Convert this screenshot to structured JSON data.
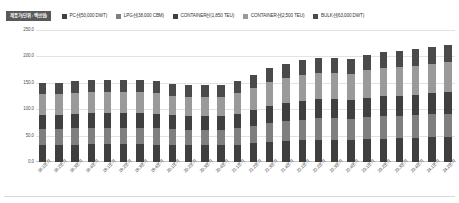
{
  "legend": {
    "unit_badge": "제품가(단위 : 백만원)",
    "items": [
      {
        "label": "PC선(50,000 DWT)",
        "color": "#3f3f3f"
      },
      {
        "label": "LPG선(38,000 CBM)",
        "color": "#7f7f7f"
      },
      {
        "label": "CONTAINER선(1,850 TEU)",
        "color": "#3f3f3f"
      },
      {
        "label": "CONTAINER선(2,500 TEU)",
        "color": "#9a9a9a"
      },
      {
        "label": "BULK선(63,000 DWT)",
        "color": "#4a4a4a"
      }
    ]
  },
  "chart_data": {
    "type": "bar",
    "stacked": true,
    "title": "",
    "xlabel": "",
    "ylabel": "",
    "ylim": [
      0,
      250
    ],
    "yticks": [
      "0.0",
      "50.0",
      "100.0",
      "150.0",
      "200.0",
      "250.0"
    ],
    "grid": true,
    "legend_position": "top",
    "categories": [
      "18.1분기",
      "18.2분기",
      "18.3분기",
      "18.4분기",
      "19.1분기",
      "19.2분기",
      "19.3분기",
      "19.4분기",
      "20.1분기",
      "20.2분기",
      "20.3분기",
      "20.4분기",
      "21.1분기",
      "21.2분기",
      "21.3분기",
      "21.4분기",
      "22.1분기",
      "22.2분기",
      "22.3분기",
      "22.4분기",
      "23.1분기",
      "23.2분기",
      "23.3분기",
      "23.4분기",
      "24.1분기",
      "24.2분기"
    ],
    "series": [
      {
        "name": "PC선(50,000 DWT)",
        "color": "#3f3f3f",
        "values": [
          32.5,
          32.5,
          33.0,
          33.5,
          33.5,
          33.5,
          33.5,
          33.0,
          32.0,
          31.5,
          31.5,
          31.5,
          33.0,
          35.5,
          38.5,
          40.0,
          41.5,
          42.5,
          42.5,
          42.0,
          43.5,
          44.5,
          45.0,
          45.5,
          46.5,
          47.0
        ]
      },
      {
        "name": "LPG선(38,000 CBM)",
        "color": "#7f7f7f",
        "values": [
          30.5,
          30.5,
          31.0,
          31.5,
          31.5,
          31.5,
          31.5,
          31.0,
          30.0,
          29.5,
          29.5,
          29.5,
          31.0,
          33.5,
          36.0,
          37.5,
          39.0,
          40.0,
          40.0,
          39.5,
          41.0,
          42.0,
          42.5,
          43.0,
          44.0,
          44.5
        ]
      },
      {
        "name": "CONTAINER선(1,850 TEU)",
        "color": "#3f3f3f",
        "values": [
          27.0,
          27.0,
          27.5,
          28.0,
          28.0,
          28.0,
          28.0,
          27.5,
          26.5,
          26.0,
          26.0,
          26.0,
          27.5,
          30.0,
          32.5,
          34.0,
          35.0,
          36.0,
          36.0,
          35.5,
          37.0,
          38.0,
          38.5,
          39.0,
          40.0,
          40.5
        ]
      },
      {
        "name": "CONTAINER선(2,500 TEU)",
        "color": "#9a9a9a",
        "values": [
          38.0,
          38.5,
          39.0,
          39.5,
          39.5,
          39.5,
          39.5,
          39.0,
          37.5,
          37.0,
          37.0,
          37.0,
          39.0,
          42.0,
          45.5,
          47.5,
          49.0,
          50.5,
          50.5,
          50.0,
          52.0,
          53.0,
          54.0,
          55.0,
          56.0,
          57.0
        ]
      },
      {
        "name": "BULK선(63,000 DWT)",
        "color": "#4a4a4a",
        "values": [
          22.0,
          22.0,
          22.5,
          23.0,
          23.0,
          23.0,
          23.0,
          22.5,
          21.5,
          21.0,
          21.0,
          21.0,
          22.5,
          24.5,
          26.5,
          27.5,
          28.5,
          29.0,
          29.0,
          28.5,
          30.0,
          30.5,
          31.0,
          31.5,
          32.0,
          32.5
        ]
      }
    ],
    "totals": [
      150.0,
      150.5,
      153.0,
      155.5,
      155.5,
      155.5,
      155.5,
      153.0,
      147.5,
      145.0,
      145.0,
      145.0,
      153.0,
      165.5,
      179.0,
      186.5,
      193.0,
      198.0,
      198.0,
      195.5,
      203.5,
      208.0,
      211.0,
      214.0,
      218.5,
      221.5
    ]
  }
}
